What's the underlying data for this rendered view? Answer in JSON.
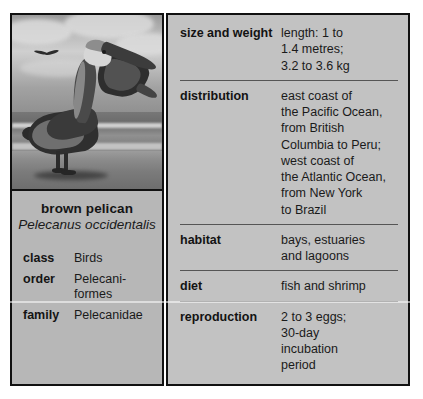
{
  "card": {
    "photo": {
      "alt": "black and white photograph of a brown pelican standing on a beach with ocean waves behind",
      "subject_icon": "pelican-icon",
      "background_icon": "beach-icon"
    },
    "caption": {
      "common_name": "brown pelican",
      "scientific_name": "Pelecanus\noccidentalis"
    },
    "taxonomy": [
      {
        "label": "class",
        "value": "Birds"
      },
      {
        "label": "order",
        "value": "Pelecani-\nformes"
      },
      {
        "label": "family",
        "value": "Pelecanidae"
      }
    ],
    "facts": [
      {
        "label": "size and weight",
        "value": "length: 1 to\n1.4 metres;\n3.2 to 3.6 kg"
      },
      {
        "label": "distribution",
        "value": "east coast of\nthe Pacific Ocean,\nfrom British\nColumbia to Peru;\nwest coast of\nthe Atlantic Ocean,\nfrom New York\nto Brazil"
      },
      {
        "label": "habitat",
        "value": "bays, estuaries\nand lagoons"
      },
      {
        "label": "diet",
        "value": "fish and shrimp"
      },
      {
        "label": "reproduction",
        "value": "2 to 3 eggs;\n30-day\nincubation\nperiod"
      }
    ]
  },
  "colors": {
    "page_background": "#ffffff",
    "panel_background": "#c2c2c2",
    "caption_background": "#b7b7b7",
    "border": "#111111",
    "divider": "#555555",
    "text": "#1a1a1a"
  }
}
